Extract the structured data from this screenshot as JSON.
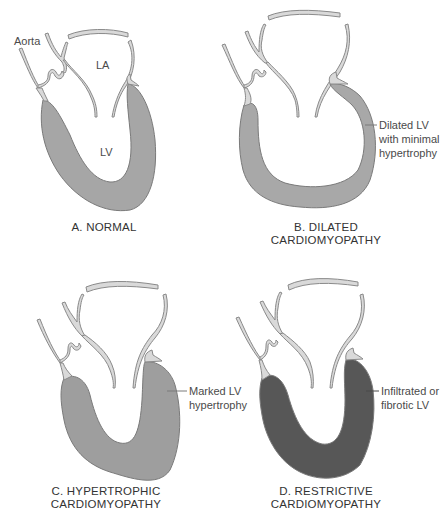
{
  "colors": {
    "background": "#ffffff",
    "vessel_fill": "#d9d9d9",
    "vessel_stroke": "#8a8a8a",
    "normal_wall": "#a6a6a6",
    "dilated_wall": "#a8a8a8",
    "hypertrophic_wall": "#9e9e9e",
    "restrictive_wall": "#575757",
    "text": "#3a3a3a"
  },
  "panels": [
    {
      "id": "A",
      "caption_line1": "A. NORMAL",
      "caption_line2": "",
      "labels": {
        "aorta": "Aorta",
        "la": "LA",
        "lv": "LV"
      }
    },
    {
      "id": "B",
      "caption_line1": "B. DILATED",
      "caption_line2": "CARDIOMYOPATHY",
      "annotation": [
        "Dilated LV",
        "with minimal",
        "hypertrophy"
      ]
    },
    {
      "id": "C",
      "caption_line1": "C. HYPERTROPHIC",
      "caption_line2": "CARDIOMYOPATHY",
      "annotation": [
        "Marked LV",
        "hypertrophy"
      ]
    },
    {
      "id": "D",
      "caption_line1": "D. RESTRICTIVE",
      "caption_line2": "CARDIOMYOPATHY",
      "annotation": [
        "Infiltrated or",
        "fibrotic LV"
      ]
    }
  ]
}
